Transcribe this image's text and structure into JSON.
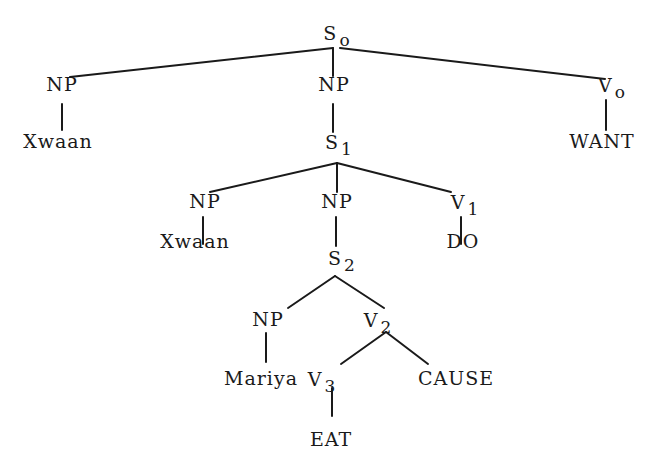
{
  "tree": {
    "nodes": [
      {
        "id": "S0",
        "label": "S",
        "sub": "o",
        "x": 337,
        "y": 36
      },
      {
        "id": "NP_a",
        "label": "NP",
        "sub": "",
        "x": 62,
        "y": 84
      },
      {
        "id": "Xwaan_a",
        "label": "Xwaan",
        "sub": "",
        "x": 58,
        "y": 141
      },
      {
        "id": "NP_b",
        "label": "NP",
        "sub": "",
        "x": 334,
        "y": 84
      },
      {
        "id": "S1",
        "label": "S",
        "sub": "1",
        "x": 339,
        "y": 145
      },
      {
        "id": "V0",
        "label": "V",
        "sub": "o",
        "x": 612,
        "y": 88
      },
      {
        "id": "WANT",
        "label": "WANT",
        "sub": "",
        "x": 602,
        "y": 141
      },
      {
        "id": "NP_c",
        "label": "NP",
        "sub": "",
        "x": 205,
        "y": 201
      },
      {
        "id": "Xwaan_b",
        "label": "Xwaan",
        "sub": "",
        "x": 195,
        "y": 241
      },
      {
        "id": "NP_d",
        "label": "NP",
        "sub": "",
        "x": 337,
        "y": 201
      },
      {
        "id": "S2",
        "label": "S",
        "sub": "2",
        "x": 342,
        "y": 261
      },
      {
        "id": "V1",
        "label": "V",
        "sub": "1",
        "x": 465,
        "y": 205
      },
      {
        "id": "DO",
        "label": "DO",
        "sub": "",
        "x": 463,
        "y": 241
      },
      {
        "id": "NP_e",
        "label": "NP",
        "sub": "",
        "x": 268,
        "y": 319
      },
      {
        "id": "V2",
        "label": "V",
        "sub": "2",
        "x": 378,
        "y": 323
      },
      {
        "id": "Mariya",
        "label": "Mariya",
        "sub": "",
        "x": 261,
        "y": 378
      },
      {
        "id": "V3",
        "label": "V",
        "sub": "3",
        "x": 322,
        "y": 382
      },
      {
        "id": "CAUSE",
        "label": "CAUSE",
        "sub": "",
        "x": 456,
        "y": 378
      },
      {
        "id": "EAT",
        "label": "EAT",
        "sub": "",
        "x": 331,
        "y": 439
      }
    ],
    "edges": [
      {
        "from": "S0",
        "to": "NP_a",
        "x1": 333,
        "y1": 48,
        "x2": 70,
        "y2": 77
      },
      {
        "from": "S0",
        "to": "NP_b",
        "x1": 333,
        "y1": 48,
        "x2": 333,
        "y2": 76
      },
      {
        "from": "S0",
        "to": "V0",
        "x1": 340,
        "y1": 48,
        "x2": 605,
        "y2": 79
      },
      {
        "from": "NP_a",
        "to": "Xwaan_a",
        "x1": 62,
        "y1": 104,
        "x2": 62,
        "y2": 130
      },
      {
        "from": "NP_b",
        "to": "S1",
        "x1": 333,
        "y1": 104,
        "x2": 333,
        "y2": 132
      },
      {
        "from": "V0",
        "to": "WANT",
        "x1": 606,
        "y1": 100,
        "x2": 606,
        "y2": 130
      },
      {
        "from": "S1",
        "to": "NP_c",
        "x1": 337,
        "y1": 163,
        "x2": 210,
        "y2": 192
      },
      {
        "from": "S1",
        "to": "NP_d",
        "x1": 337,
        "y1": 163,
        "x2": 337,
        "y2": 192
      },
      {
        "from": "S1",
        "to": "V1",
        "x1": 337,
        "y1": 163,
        "x2": 451,
        "y2": 192
      },
      {
        "from": "NP_c",
        "to": "Xwaan_b",
        "x1": 203,
        "y1": 217,
        "x2": 203,
        "y2": 244
      },
      {
        "from": "NP_d",
        "to": "S2",
        "x1": 336,
        "y1": 217,
        "x2": 336,
        "y2": 246
      },
      {
        "from": "V1",
        "to": "DO",
        "x1": 461,
        "y1": 217,
        "x2": 461,
        "y2": 244
      },
      {
        "from": "S2",
        "to": "NP_e",
        "x1": 335,
        "y1": 276,
        "x2": 288,
        "y2": 308
      },
      {
        "from": "S2",
        "to": "V2",
        "x1": 335,
        "y1": 276,
        "x2": 384,
        "y2": 308
      },
      {
        "from": "NP_e",
        "to": "Mariya",
        "x1": 266,
        "y1": 333,
        "x2": 266,
        "y2": 362
      },
      {
        "from": "V2",
        "to": "V3",
        "x1": 386,
        "y1": 332,
        "x2": 341,
        "y2": 364
      },
      {
        "from": "V2",
        "to": "CAUSE",
        "x1": 386,
        "y1": 332,
        "x2": 428,
        "y2": 364
      },
      {
        "from": "V3",
        "to": "EAT",
        "x1": 332,
        "y1": 388,
        "x2": 332,
        "y2": 416
      }
    ]
  },
  "colors": {
    "ink": "#1a1a1a",
    "background": "#ffffff"
  }
}
